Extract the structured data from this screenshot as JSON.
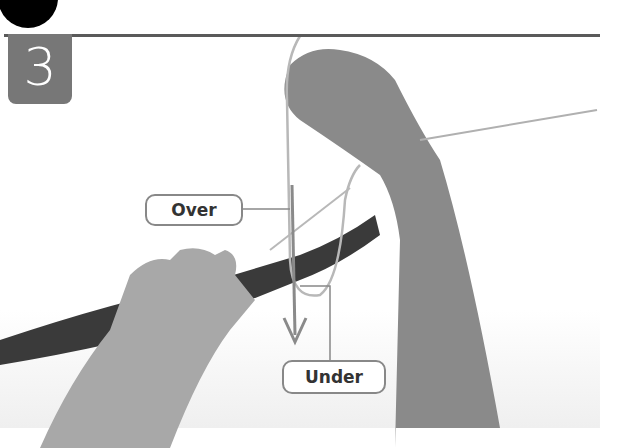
{
  "step": {
    "number": "3"
  },
  "callouts": {
    "over": "Over",
    "under": "Under"
  },
  "colors": {
    "badge": "#777777",
    "rule": "#5a5a5a",
    "arrow": "#8a8a8a",
    "rope": "#3a3a3a",
    "skin": "#9a9a9a"
  }
}
